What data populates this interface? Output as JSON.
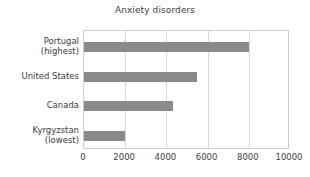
{
  "chart_data": {
    "type": "bar",
    "orientation": "horizontal",
    "title": "Anxiety disorders",
    "xlabel": "",
    "ylabel": "",
    "categories": [
      "Portugal (highest)",
      "United States",
      "Canada",
      "Kyrgyzstan (lowest)"
    ],
    "category_lines": [
      [
        "Portugal",
        "(highest)"
      ],
      [
        "United States"
      ],
      [
        "Canada"
      ],
      [
        "Kyrgyzstan",
        "(lowest)"
      ]
    ],
    "values": [
      8000,
      5500,
      4300,
      2000
    ],
    "xlim": [
      0,
      10000
    ],
    "xticks": [
      0,
      2000,
      4000,
      6000,
      8000,
      10000
    ],
    "xtick_labels": [
      "0",
      "2000",
      "4000",
      "6000",
      "8000",
      "10000"
    ],
    "grid": "vertical",
    "legend": null,
    "bar_color": "#8a8a8a",
    "grid_color": "#d8d8d8",
    "frame_color": "#cfcfcf",
    "text_color": "#3d3d3d"
  }
}
